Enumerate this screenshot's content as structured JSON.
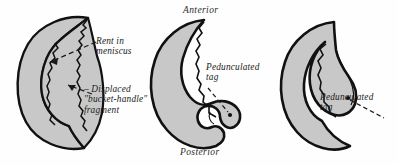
{
  "figure": {
    "background_color": "#fefefe",
    "ink_color": "#111111",
    "cartilage_fill": "#c8c8c8"
  },
  "panels": [
    {
      "id": "panel-1",
      "name": "bucket-handle-tear",
      "labels": {
        "rent": "Rent in\nmeniscus",
        "displaced": "– Displaced\n\"bucket-handle\"\nfragment"
      }
    },
    {
      "id": "panel-2",
      "name": "pedunculated-tag-posterior",
      "orientation": {
        "anterior": "Anterior",
        "posterior": "Posterior"
      },
      "labels": {
        "tag": "Pedunculated\ntag"
      }
    },
    {
      "id": "panel-3",
      "name": "pedunculated-tag-anterior",
      "labels": {
        "tag": "Pedunculated\ntag"
      }
    }
  ]
}
